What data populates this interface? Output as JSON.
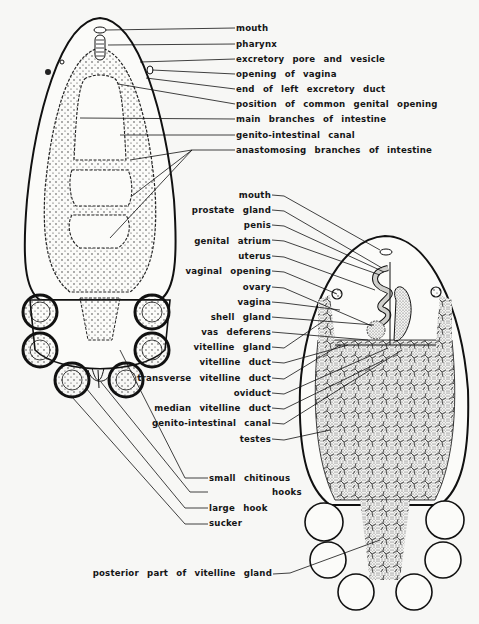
{
  "figure": {
    "left_view": {
      "description": "dorsal view of whole worm showing intestine, opisthaptor with suckers",
      "labels": [
        {
          "id": "mouth",
          "text": "mouth",
          "x": 236,
          "y": 23
        },
        {
          "id": "pharynx",
          "text": "pharynx",
          "x": 236,
          "y": 39
        },
        {
          "id": "excretory-pore",
          "text": "excretory pore and vesicle",
          "x": 236,
          "y": 54
        },
        {
          "id": "opening-vagina",
          "text": "opening of vagina",
          "x": 236,
          "y": 69
        },
        {
          "id": "end-left-excretory-duct",
          "text": "end of left excretory duct",
          "x": 236,
          "y": 84
        },
        {
          "id": "common-genital-opening",
          "text": "position of common genital opening",
          "x": 236,
          "y": 99
        },
        {
          "id": "main-branches-intestine",
          "text": "main branches of intestine",
          "x": 236,
          "y": 114
        },
        {
          "id": "genito-intestinal-canal-1",
          "text": "genito-intestinal canal",
          "x": 236,
          "y": 130
        },
        {
          "id": "anastomosing-branches",
          "text": "anastomosing branches of intestine",
          "x": 236,
          "y": 145
        },
        {
          "id": "small-chitinous-hooks",
          "text": "small chitinous",
          "x": 209,
          "y": 474
        },
        {
          "id": "small-chitinous-hooks-2",
          "text": "hooks",
          "x": 272,
          "y": 488
        },
        {
          "id": "large-hook",
          "text": "large hook",
          "x": 209,
          "y": 505
        },
        {
          "id": "sucker",
          "text": "sucker",
          "x": 209,
          "y": 520
        }
      ]
    },
    "right_view": {
      "description": "ventral view showing reproductive organs, testes, vitelline glands",
      "labels": [
        {
          "id": "mouth-2",
          "text": "mouth",
          "right": 271,
          "y": 190
        },
        {
          "id": "prostate-gland",
          "text": "prostate gland",
          "right": 271,
          "y": 205
        },
        {
          "id": "penis",
          "text": "penis",
          "right": 271,
          "y": 220
        },
        {
          "id": "genital-atrium",
          "text": "genital atrium",
          "right": 271,
          "y": 236
        },
        {
          "id": "uterus",
          "text": "uterus",
          "right": 271,
          "y": 251
        },
        {
          "id": "vaginal-opening",
          "text": "vaginal opening",
          "right": 271,
          "y": 266
        },
        {
          "id": "ovary",
          "text": "ovary",
          "right": 271,
          "y": 282
        },
        {
          "id": "vagina",
          "text": "vagina",
          "right": 271,
          "y": 297
        },
        {
          "id": "shell-gland",
          "text": "shell gland",
          "right": 271,
          "y": 312
        },
        {
          "id": "vas-deferens",
          "text": "vas deferens",
          "right": 271,
          "y": 327
        },
        {
          "id": "vitelline-gland",
          "text": "vitelline gland",
          "right": 271,
          "y": 342
        },
        {
          "id": "vitelline-duct",
          "text": "vitelline duct",
          "right": 271,
          "y": 357
        },
        {
          "id": "transverse-vitelline-duct",
          "text": "transverse vitelline duct",
          "right": 271,
          "y": 373
        },
        {
          "id": "oviduct",
          "text": "oviduct",
          "right": 271,
          "y": 388
        },
        {
          "id": "median-vitelline-duct",
          "text": "median vitelline duct",
          "right": 271,
          "y": 403
        },
        {
          "id": "genito-intestinal-canal-2",
          "text": "genito-intestinal canal",
          "right": 271,
          "y": 418
        },
        {
          "id": "testes",
          "text": "testes",
          "right": 271,
          "y": 434
        },
        {
          "id": "posterior-vitelline-gland",
          "text": "posterior part of vitelline gland",
          "right": 272,
          "y": 569
        }
      ]
    }
  }
}
